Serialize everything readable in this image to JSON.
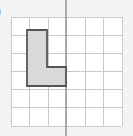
{
  "figure": {
    "background_color": "#f4f4f4",
    "canvas": {
      "width": 133,
      "height": 136
    }
  },
  "edge_mark": {
    "text": ")",
    "description": "clipped glyph at left edge",
    "color": "#3a3a3a"
  },
  "chart_data": {
    "type": "scatter",
    "subtitle": "",
    "xlabel": "",
    "ylabel": "",
    "grid": true,
    "legend": false,
    "legend_position": "none",
    "xlim": [
      0,
      6
    ],
    "ylim": [
      0,
      6
    ],
    "x_tick_labels": [],
    "y_tick_labels": [],
    "grid_columns": 6,
    "grid_rows": 6,
    "grid_line_color": "#c9c9c9",
    "grid_cell_color": "#ffffff",
    "grid_pixel_bounds": {
      "left": 11,
      "top": 17,
      "right": 122,
      "bottom": 126
    },
    "axis_lines": [
      {
        "name": "vertical-axis-line",
        "orientation": "vertical",
        "grid_x": 3,
        "pixel_x": 66,
        "color": "#9a9a9a",
        "width": 1.6,
        "extends_beyond_grid": true
      }
    ],
    "shapes": [
      {
        "name": "l-shape-polygon",
        "kind": "polygon",
        "fill": "#d9d9d9",
        "stroke": "#555555",
        "stroke_width": 1.8,
        "grid_vertices": [
          [
            0.87,
            5.3
          ],
          [
            1.95,
            5.3
          ],
          [
            1.95,
            3.25
          ],
          [
            2.98,
            3.25
          ],
          [
            2.98,
            2.2
          ],
          [
            0.87,
            2.2
          ]
        ],
        "pixel_vertices": [
          [
            27,
            30
          ],
          [
            47,
            30
          ],
          [
            47,
            67
          ],
          [
            66,
            67
          ],
          [
            66,
            86
          ],
          [
            27,
            86
          ]
        ],
        "pixel_points_string": "27,30 47,30 47,67 66,67 66,86 27,86"
      }
    ],
    "annotations": []
  }
}
